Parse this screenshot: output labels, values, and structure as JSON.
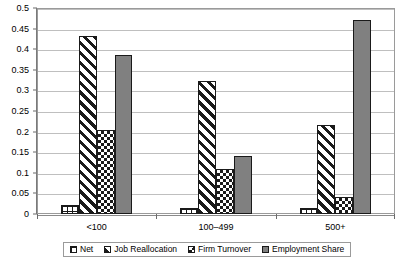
{
  "chart_data": {
    "type": "bar",
    "title": "",
    "subtitle": "",
    "xlabel": "",
    "ylabel": "",
    "categories": [
      "<100",
      "100–499",
      "500+"
    ],
    "series": [
      {
        "name": "Net",
        "pattern": "grid-lines",
        "values": [
          0.022,
          0.014,
          0.014
        ]
      },
      {
        "name": "Job Reallocation",
        "pattern": "diagonal-hatch",
        "values": [
          0.432,
          0.322,
          0.215
        ]
      },
      {
        "name": "Firm Turnover",
        "pattern": "checkerboard",
        "values": [
          0.205,
          0.11,
          0.042
        ]
      },
      {
        "name": "Employment Share",
        "pattern": "solid-gray",
        "values": [
          0.385,
          0.14,
          0.472
        ]
      }
    ],
    "ylim": [
      0,
      0.5
    ],
    "ytick_step": 0.05,
    "yticks": [
      "0",
      "0.05",
      "0.1",
      "0.15",
      "0.2",
      "0.25",
      "0.3",
      "0.35",
      "0.4",
      "0.45",
      "0.5"
    ],
    "grid": true,
    "legend_position": "bottom",
    "colors": {
      "series_solid": "#808080",
      "pattern_ink": "#1a1a1a",
      "plot_background": "#ffffff",
      "gridline": "#bfbfbf",
      "axis_line": "#7a7a7a",
      "frame_border": "#9a9a9a"
    }
  }
}
